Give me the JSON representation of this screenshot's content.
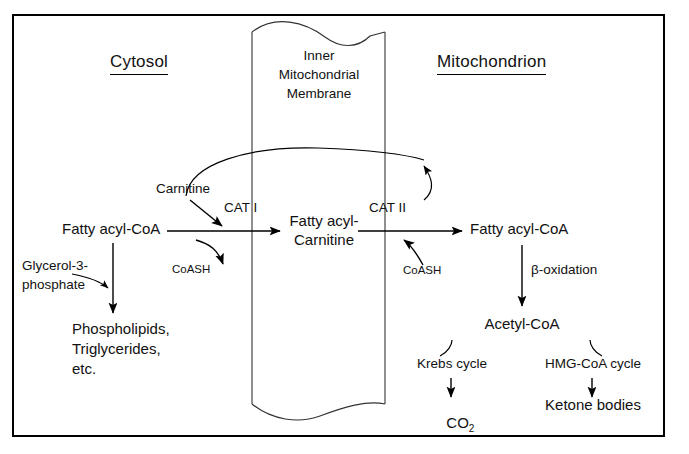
{
  "figure": {
    "title_cytosol": "Cytosol",
    "title_mitochondrion": "Mitochondrion",
    "membrane_label_line1": "Inner",
    "membrane_label_line2": "Mitochondrial",
    "membrane_label_line3": "Membrane"
  },
  "nodes": {
    "carnitine": "Carnitine",
    "fatty_acyl_coa_left": "Fatty acyl-CoA",
    "cat1": "CAT I",
    "coash_left": "CoASH",
    "fatty_acyl_carnitine_line1": "Fatty acyl-",
    "fatty_acyl_carnitine_line2": "Carnitine",
    "cat2": "CAT II",
    "coash_right": "CoASH",
    "fatty_acyl_coa_right": "Fatty acyl-CoA",
    "beta_oxidation": "β-oxidation",
    "acetyl_coa": "Acetyl-CoA",
    "krebs_cycle": "Krebs cycle",
    "hmg_coa_cycle": "HMG-CoA cycle",
    "co2": "CO",
    "co2_subscript": "2",
    "ketone_bodies": "Ketone bodies",
    "glycerol_3_phosphate_line1": "Glycerol-3-",
    "glycerol_3_phosphate_line2": "phosphate",
    "products_line1": "Phospholipids,",
    "products_line2": "Triglycerides,",
    "products_line3": "etc."
  },
  "colors": {
    "ink": "#111111",
    "stroke": "#000000",
    "background": "#ffffff",
    "membrane_stroke": "#333333"
  }
}
